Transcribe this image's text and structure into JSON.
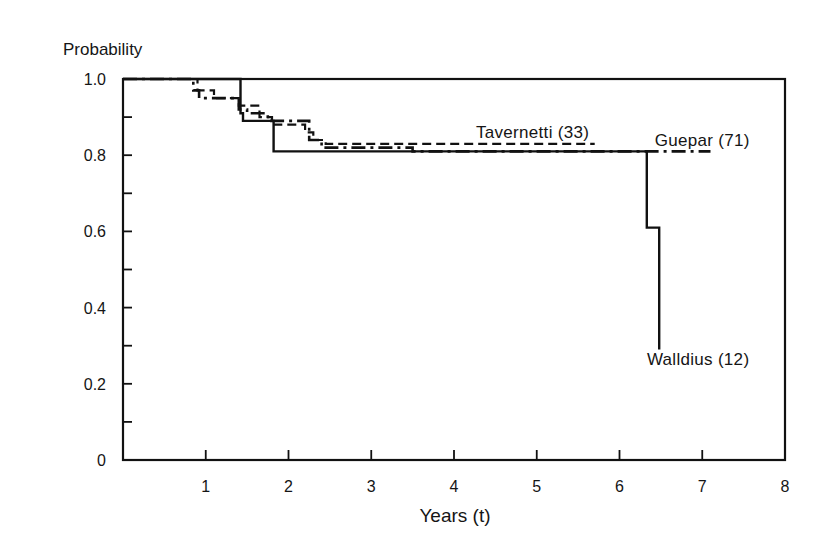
{
  "chart_data": {
    "type": "line",
    "subtype": "step (Kaplan-Meier survival curves)",
    "title": "",
    "ylabel": "Probability",
    "xlabel": "Years (t)",
    "xlim": [
      0,
      8
    ],
    "ylim": [
      0,
      1.0
    ],
    "x_ticks": [
      1,
      2,
      3,
      4,
      5,
      6,
      7,
      8
    ],
    "x_tick_labels": [
      "1",
      "2",
      "3",
      "4",
      "5",
      "6",
      "7",
      "8"
    ],
    "y_ticks": [
      0,
      0.1,
      0.2,
      0.3,
      0.4,
      0.5,
      0.6,
      0.7,
      0.8,
      0.9,
      1.0
    ],
    "y_tick_labels": [
      "0",
      "",
      "0.2",
      "",
      "0.4",
      "",
      "0.6",
      "",
      "0.8",
      "",
      "1.0"
    ],
    "grid": false,
    "legend": "inline labels",
    "series": [
      {
        "name": "Walldius (12)",
        "line_style": "solid",
        "label": "Walldius (12)",
        "points": [
          [
            0,
            1.0
          ],
          [
            1.42,
            1.0
          ],
          [
            1.42,
            0.91
          ],
          [
            1.45,
            0.91
          ],
          [
            1.45,
            0.89
          ],
          [
            1.82,
            0.89
          ],
          [
            1.82,
            0.81
          ],
          [
            6.33,
            0.81
          ],
          [
            6.33,
            0.61
          ],
          [
            6.48,
            0.61
          ],
          [
            6.48,
            0.29
          ]
        ]
      },
      {
        "name": "Guepar (71)",
        "line_style": "dash-dot",
        "label": "Guepar (71)",
        "points": [
          [
            0,
            1.0
          ],
          [
            0.85,
            1.0
          ],
          [
            0.85,
            0.97
          ],
          [
            0.92,
            0.97
          ],
          [
            0.92,
            0.95
          ],
          [
            1.4,
            0.95
          ],
          [
            1.4,
            0.92
          ],
          [
            1.5,
            0.92
          ],
          [
            1.5,
            0.91
          ],
          [
            1.75,
            0.91
          ],
          [
            1.75,
            0.89
          ],
          [
            2.25,
            0.89
          ],
          [
            2.25,
            0.84
          ],
          [
            2.4,
            0.84
          ],
          [
            2.4,
            0.82
          ],
          [
            3.5,
            0.82
          ],
          [
            3.5,
            0.81
          ],
          [
            7.1,
            0.81
          ]
        ]
      },
      {
        "name": "Tavernetti (33)",
        "line_style": "dashed",
        "label": "Tavernetti (33)",
        "points": [
          [
            0,
            1.0
          ],
          [
            0.9,
            1.0
          ],
          [
            0.9,
            0.97
          ],
          [
            1.1,
            0.97
          ],
          [
            1.1,
            0.95
          ],
          [
            1.4,
            0.95
          ],
          [
            1.4,
            0.93
          ],
          [
            1.65,
            0.93
          ],
          [
            1.65,
            0.9
          ],
          [
            1.8,
            0.9
          ],
          [
            1.8,
            0.88
          ],
          [
            2.2,
            0.88
          ],
          [
            2.2,
            0.86
          ],
          [
            2.3,
            0.86
          ],
          [
            2.3,
            0.84
          ],
          [
            2.45,
            0.84
          ],
          [
            2.45,
            0.83
          ],
          [
            5.7,
            0.83
          ]
        ]
      }
    ],
    "annotations": [
      {
        "text": "Tavernetti (33)",
        "x": 4.95,
        "y": 0.845
      },
      {
        "text": "Guepar (71)",
        "x": 7.0,
        "y": 0.825
      },
      {
        "text": "Walldius (12)",
        "x": 6.95,
        "y": 0.25
      }
    ]
  }
}
